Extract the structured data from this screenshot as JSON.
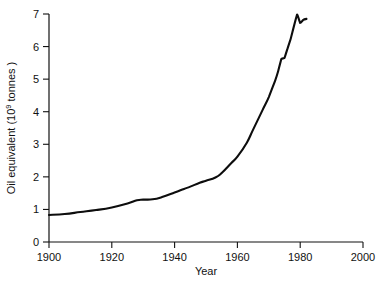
{
  "chart_data": {
    "type": "line",
    "title": "",
    "xlabel": "Year",
    "ylabel": "Oil equivalent (10⁹ tonnes )",
    "ylabel_parts": {
      "pre": "Oil equivalent  (10",
      "sup": "9",
      "post": " tonnes )"
    },
    "xlim": [
      1900,
      2000
    ],
    "ylim": [
      0,
      7
    ],
    "xticks": [
      1900,
      1920,
      1940,
      1960,
      1980,
      2000
    ],
    "xtick_labels": [
      "1900",
      "1920",
      "1940",
      "1960",
      "1980",
      "2000"
    ],
    "yticks": [
      0,
      1,
      2,
      3,
      4,
      5,
      6,
      7
    ],
    "ytick_labels": [
      "0",
      "1",
      "2",
      "3",
      "4",
      "5",
      "6",
      "7"
    ],
    "grid": false,
    "legend": null,
    "legend_position": "none",
    "series": [
      {
        "name": "World energy consumption",
        "color": "#0d0d0d",
        "x": [
          1900,
          1905,
          1910,
          1915,
          1920,
          1925,
          1928,
          1930,
          1933,
          1936,
          1940,
          1943,
          1945,
          1948,
          1950,
          1953,
          1955,
          1958,
          1960,
          1963,
          1965,
          1968,
          1970,
          1972,
          1973,
          1974,
          1975,
          1976,
          1977,
          1979,
          1980,
          1981,
          1982
        ],
        "y": [
          0.83,
          0.86,
          0.92,
          0.98,
          1.06,
          1.18,
          1.28,
          1.3,
          1.31,
          1.38,
          1.52,
          1.63,
          1.7,
          1.82,
          1.88,
          1.98,
          2.12,
          2.42,
          2.62,
          3.05,
          3.45,
          4.05,
          4.45,
          4.95,
          5.25,
          5.62,
          5.65,
          5.95,
          6.25,
          6.98,
          6.72,
          6.82,
          6.85
        ]
      }
    ]
  },
  "axes": {
    "spine_color": "#111111",
    "xlabel_text": "Year"
  }
}
